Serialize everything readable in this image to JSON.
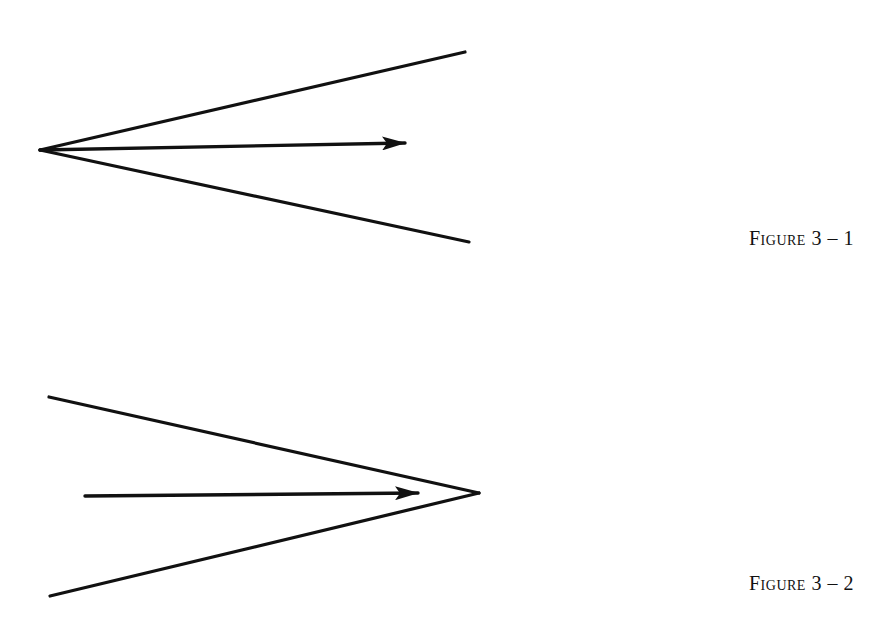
{
  "figures": [
    {
      "caption": "Figure 3 – 1",
      "description": "Diverging angle opening to the right with an arrow pointing outward from the vertex",
      "vertex": [
        40,
        150
      ],
      "upper_end": [
        465,
        52
      ],
      "lower_end": [
        469,
        242
      ],
      "arrow": {
        "from": [
          40,
          150
        ],
        "to": [
          405,
          143
        ]
      }
    },
    {
      "caption": "Figure 3 – 2",
      "description": "Converging angle closing to the right with an arrow pointing toward the vertex",
      "vertex": [
        479,
        493
      ],
      "upper_end": [
        49,
        397
      ],
      "lower_end": [
        50,
        596
      ],
      "arrow": {
        "from": [
          85,
          496
        ],
        "to": [
          418,
          493
        ]
      }
    }
  ],
  "colors": {
    "ink": "#111111",
    "background": "#ffffff"
  }
}
